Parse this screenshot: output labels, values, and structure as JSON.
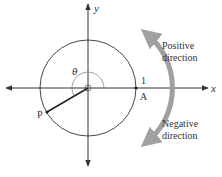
{
  "diagram": {
    "type": "unit-circle-angle-direction",
    "axes": {
      "x_label": "x",
      "y_label": "y"
    },
    "circle": {
      "radius_label": "1"
    },
    "points": {
      "A": "A",
      "P": "P"
    },
    "angle_label": "θ",
    "directions": {
      "positive": {
        "line1": "Positive",
        "line2": "direction"
      },
      "negative": {
        "line1": "Negative",
        "line2": "direction"
      }
    },
    "colors": {
      "lines": "#333333",
      "thin_arc": "#888888",
      "direction_arrow": "#a0a0a0",
      "text": "#333333"
    }
  }
}
